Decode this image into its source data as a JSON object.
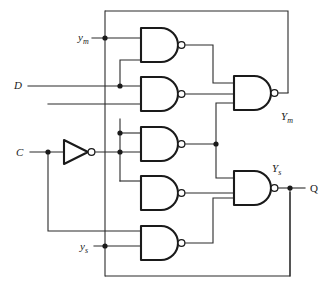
{
  "diagram": {
    "colors": {
      "background": "#ffffff",
      "gate_outline": "#1a1a1a",
      "wire": "#2b2b2b"
    },
    "inputs": [
      {
        "id": "ym-input",
        "base": "y",
        "subscript": "m",
        "x": 78,
        "y": 41
      },
      {
        "id": "d-input",
        "base": "D",
        "subscript": "",
        "x": 14,
        "y": 89
      },
      {
        "id": "c-input",
        "base": "C",
        "subscript": "",
        "x": 16,
        "y": 156
      },
      {
        "id": "ys-input",
        "base": "y",
        "subscript": "s",
        "x": 80,
        "y": 250
      }
    ],
    "outputs": [
      {
        "id": "ym-output",
        "base": "Y",
        "subscript": "m",
        "x": 281,
        "y": 120
      },
      {
        "id": "ys-output",
        "base": "Y",
        "subscript": "s",
        "x": 272,
        "y": 172
      },
      {
        "id": "q-output",
        "base": "Q",
        "subscript": "",
        "x": 310,
        "y": 192
      }
    ],
    "gates": [
      {
        "id": "nand-1",
        "type": "NAND",
        "inputs": 2,
        "x": 140,
        "y": 28
      },
      {
        "id": "nand-2",
        "type": "NAND",
        "inputs": 2,
        "x": 140,
        "y": 77
      },
      {
        "id": "nand-3",
        "type": "NAND",
        "inputs": 2,
        "x": 140,
        "y": 127
      },
      {
        "id": "nand-4",
        "type": "NAND",
        "inputs": 2,
        "x": 140,
        "y": 176
      },
      {
        "id": "nand-5",
        "type": "NAND",
        "inputs": 2,
        "x": 140,
        "y": 226
      },
      {
        "id": "nand-ym",
        "type": "NAND",
        "inputs": 3,
        "x": 233,
        "y": 76
      },
      {
        "id": "nand-ys",
        "type": "NAND",
        "inputs": 3,
        "x": 233,
        "y": 171
      },
      {
        "id": "inverter-c",
        "type": "NOT",
        "inputs": 1,
        "x": 63,
        "y": 152
      }
    ]
  }
}
